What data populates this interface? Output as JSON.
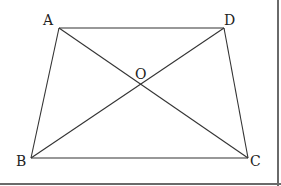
{
  "diagram": {
    "type": "trapezoid-with-diagonals",
    "points": {
      "A": {
        "label": "A",
        "x": 59,
        "y": 28,
        "label_x": 43,
        "label_y": 25
      },
      "D": {
        "label": "D",
        "x": 224,
        "y": 28,
        "label_x": 224,
        "label_y": 25
      },
      "B": {
        "label": "B",
        "x": 31,
        "y": 158,
        "label_x": 16,
        "label_y": 166
      },
      "C": {
        "label": "C",
        "x": 248,
        "y": 158,
        "label_x": 250,
        "label_y": 166
      },
      "O": {
        "label": "O",
        "x": 140,
        "y": 84,
        "label_x": 135,
        "label_y": 79
      }
    },
    "edges": [
      [
        "A",
        "D"
      ],
      [
        "D",
        "C"
      ],
      [
        "C",
        "B"
      ],
      [
        "B",
        "A"
      ]
    ],
    "diagonals": [
      [
        "A",
        "C"
      ],
      [
        "B",
        "D"
      ]
    ],
    "colors": {
      "stroke": "#333333",
      "label": "#222222",
      "frame": "#6a6a6a"
    }
  }
}
